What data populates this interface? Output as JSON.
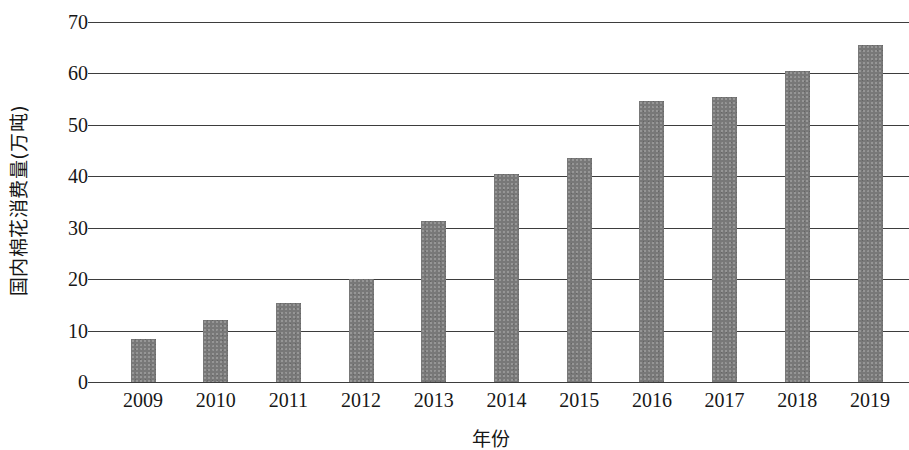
{
  "chart_data": {
    "type": "bar",
    "title": "",
    "xlabel": "年份",
    "ylabel": "国内棉花消费量(万吨)",
    "categories": [
      "2009",
      "2010",
      "2011",
      "2012",
      "2013",
      "2014",
      "2015",
      "2016",
      "2017",
      "2018",
      "2019"
    ],
    "values": [
      8.3,
      12.1,
      15.3,
      20.1,
      31.3,
      40.5,
      43.5,
      54.6,
      55.4,
      60.4,
      65.5
    ],
    "ylim": [
      0,
      70
    ],
    "ytick_labels": [
      "70",
      "60",
      "50",
      "40",
      "30",
      "20",
      "10",
      "0"
    ],
    "ytick_values": [
      70,
      60,
      50,
      40,
      30,
      20,
      10,
      0
    ],
    "grid": true,
    "legend": "none",
    "bar_color": "#787878",
    "grid_color": "#3d3d3d",
    "background_color": "#ffffff",
    "note": "右侧被裁切 / chart cropped at right edge"
  }
}
